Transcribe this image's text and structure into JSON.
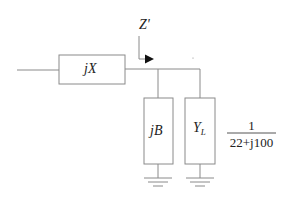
{
  "diagram": {
    "title": "",
    "series_element": {
      "label": "jX"
    },
    "impedance_marker": {
      "label": "Z'"
    },
    "shunt_elements": [
      {
        "label": "jB"
      },
      {
        "label_main": "Y",
        "label_sub": "L"
      }
    ],
    "annotation": {
      "numerator": "1",
      "denominator": "22+j100"
    },
    "colors": {
      "line": "#8a8a8a",
      "text": "#222222",
      "arrow": "#111111",
      "background": "#ffffff"
    }
  }
}
